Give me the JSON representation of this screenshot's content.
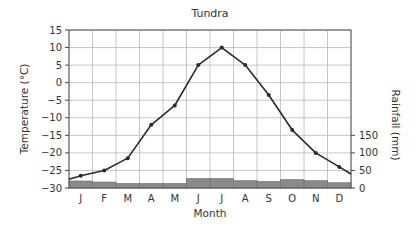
{
  "chart_data": {
    "type": "line+bar",
    "title": "Tundra",
    "xlabel": "Month",
    "ylabel_left": "Temperature (°C)",
    "ylabel_right": "Rainfall (mm)",
    "categories": [
      "J",
      "F",
      "M",
      "A",
      "M",
      "J",
      "J",
      "A",
      "S",
      "O",
      "N",
      "D"
    ],
    "ylim_left": [
      -30,
      15
    ],
    "yticks_left": [
      15,
      10,
      5,
      0,
      -5,
      -10,
      -15,
      -20,
      -25,
      -30
    ],
    "ylim_right": [
      0,
      450
    ],
    "yticks_right": [
      0,
      50,
      100,
      150
    ],
    "grid": true,
    "series": [
      {
        "name": "Temperature",
        "type": "line",
        "axis": "left",
        "values": [
          -26.5,
          -25,
          -21.5,
          -12,
          -6.5,
          5,
          10,
          5,
          -3.5,
          -13.5,
          -20,
          -24
        ],
        "line_start": -27.5,
        "line_end": -26,
        "color": "#2b2b2b"
      },
      {
        "name": "Rainfall",
        "type": "bar",
        "axis": "right",
        "values": [
          20,
          17,
          13,
          13,
          13,
          27,
          27,
          21,
          19,
          24,
          21,
          15
        ],
        "color": "#8a8a8a"
      }
    ]
  }
}
